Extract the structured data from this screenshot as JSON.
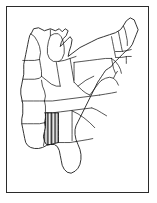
{
  "figure": {
    "width_px": 157,
    "height_px": 203
  },
  "frame": {
    "name": "map-border",
    "stroke_color": "#2b2b2b",
    "background_color": "#ffffff",
    "left_px": 6,
    "top_px": 6,
    "width_px": 143,
    "height_px": 187
  },
  "style": {
    "outline_color": "#1a1a1a",
    "fill_color": "#ffffff",
    "highlight_color": "#141414",
    "highlight_pattern": "vertical-hatch",
    "hatch_spacing_px": 1.4,
    "hatch_stroke_width_px": 0.7
  },
  "map": {
    "region": "Eastern United States",
    "projection_note": "simplified outline",
    "highlighted_states": [
      {
        "name": "Mississippi",
        "abbreviation": "MS",
        "pattern": "vertical-hatch"
      }
    ],
    "states": [
      {
        "abbreviation": "MN",
        "name": "Minnesota"
      },
      {
        "abbreviation": "WI",
        "name": "Wisconsin"
      },
      {
        "abbreviation": "MI",
        "name": "Michigan"
      },
      {
        "abbreviation": "IA",
        "name": "Iowa"
      },
      {
        "abbreviation": "IL",
        "name": "Illinois"
      },
      {
        "abbreviation": "IN",
        "name": "Indiana"
      },
      {
        "abbreviation": "OH",
        "name": "Ohio"
      },
      {
        "abbreviation": "MO",
        "name": "Missouri"
      },
      {
        "abbreviation": "KY",
        "name": "Kentucky"
      },
      {
        "abbreviation": "TN",
        "name": "Tennessee"
      },
      {
        "abbreviation": "AR",
        "name": "Arkansas"
      },
      {
        "abbreviation": "LA",
        "name": "Louisiana"
      },
      {
        "abbreviation": "MS",
        "name": "Mississippi"
      },
      {
        "abbreviation": "AL",
        "name": "Alabama"
      },
      {
        "abbreviation": "GA",
        "name": "Georgia"
      },
      {
        "abbreviation": "FL",
        "name": "Florida"
      },
      {
        "abbreviation": "SC",
        "name": "South Carolina"
      },
      {
        "abbreviation": "NC",
        "name": "North Carolina"
      },
      {
        "abbreviation": "VA",
        "name": "Virginia"
      },
      {
        "abbreviation": "WV",
        "name": "West Virginia"
      },
      {
        "abbreviation": "MD",
        "name": "Maryland"
      },
      {
        "abbreviation": "DE",
        "name": "Delaware"
      },
      {
        "abbreviation": "NJ",
        "name": "New Jersey"
      },
      {
        "abbreviation": "PA",
        "name": "Pennsylvania"
      },
      {
        "abbreviation": "NY",
        "name": "New York"
      },
      {
        "abbreviation": "CT",
        "name": "Connecticut"
      },
      {
        "abbreviation": "RI",
        "name": "Rhode Island"
      },
      {
        "abbreviation": "MA",
        "name": "Massachusetts"
      },
      {
        "abbreviation": "VT",
        "name": "Vermont"
      },
      {
        "abbreviation": "NH",
        "name": "New Hampshire"
      },
      {
        "abbreviation": "ME",
        "name": "Maine"
      }
    ]
  }
}
